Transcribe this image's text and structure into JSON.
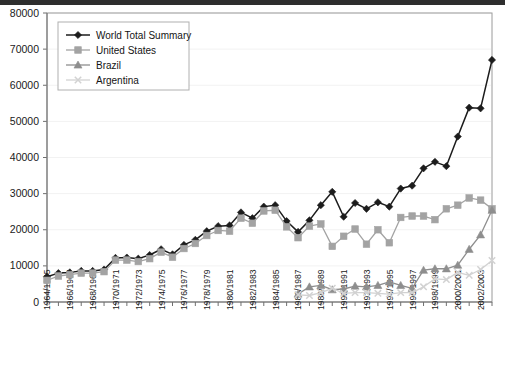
{
  "chart_data": {
    "type": "line",
    "title": "",
    "subtitle": "",
    "xlabel": "",
    "ylabel": "",
    "ylim": [
      0,
      80000
    ],
    "ytick_step": 10000,
    "yticks": [
      "0",
      "10000",
      "20000",
      "30000",
      "40000",
      "50000",
      "60000",
      "70000",
      "80000"
    ],
    "grid": true,
    "grid_axis": "y",
    "legend_position": "top-left",
    "x": [
      "1964/1965",
      "1965/1966",
      "1966/1967",
      "1967/1968",
      "1968/1969",
      "1969/1970",
      "1970/1971",
      "1971/1972",
      "1972/1973",
      "1973/1974",
      "1974/1975",
      "1975/1976",
      "1976/1977",
      "1977/1978",
      "1978/1979",
      "1979/1980",
      "1980/1981",
      "1981/1982",
      "1982/1983",
      "1983/1984",
      "1984/1985",
      "1985/1986",
      "1986/1987",
      "1987/1988",
      "1988/1989",
      "1989/1990",
      "1990/1991",
      "1991/1992",
      "1992/1993",
      "1993/1994",
      "1994/1995",
      "1995/1996",
      "1996/1997",
      "1997/1998",
      "1998/1999",
      "1999/2000",
      "2000/2001",
      "2001/2002",
      "2002/2003",
      "2003/2004"
    ],
    "xtick_labels_shown": [
      "1964/1965",
      "1966/1967",
      "1968/1969",
      "1970/1971",
      "1972/1973",
      "1974/1975",
      "1976/1977",
      "1978/1979",
      "1980/1981",
      "1982/1983",
      "1984/1985",
      "1986/1987",
      "1988/1989",
      "1990/1991",
      "1992/1993",
      "1994/1995",
      "1996/1997",
      "1998/1999",
      "2000/2001",
      "2002/2003"
    ],
    "xtick_label_interval": 2,
    "series": [
      {
        "name": "World Total Summary",
        "marker": "diamond",
        "color": "#1c1c1c",
        "values": [
          7000,
          8000,
          8200,
          8600,
          8600,
          9000,
          12200,
          12300,
          12000,
          13000,
          14600,
          13200,
          15800,
          17200,
          19600,
          21000,
          21200,
          24800,
          23200,
          26400,
          26800,
          22400,
          19400,
          22600,
          26800,
          30500,
          23600,
          27400,
          25800,
          27600,
          26400,
          31400,
          32200,
          37000,
          38800,
          37600,
          45800,
          53800,
          53600,
          67000
        ]
      },
      {
        "name": "United States",
        "marker": "square",
        "color": "#a3a3a3",
        "values": [
          6000,
          7200,
          7600,
          8000,
          8000,
          8400,
          11600,
          11600,
          11200,
          12000,
          13800,
          12400,
          14800,
          16200,
          18400,
          19800,
          19600,
          23200,
          21800,
          25200,
          25400,
          20800,
          17800,
          21000,
          21600,
          15400,
          18200,
          20200,
          16000,
          20000,
          16400,
          23400,
          23800,
          23800,
          22800,
          25800,
          26800,
          28800,
          28200,
          25800
        ]
      },
      {
        "name": "Brazil",
        "marker": "triangle",
        "color": "#8e8e8e",
        "values": [
          null,
          null,
          null,
          null,
          null,
          null,
          null,
          null,
          null,
          null,
          null,
          null,
          null,
          null,
          null,
          null,
          null,
          null,
          null,
          null,
          null,
          null,
          2200,
          4200,
          4600,
          3400,
          3600,
          4400,
          4200,
          4600,
          5600,
          4600,
          3800,
          8800,
          9200,
          9200,
          10200,
          14600,
          18600,
          25400
        ]
      },
      {
        "name": "Argentina",
        "marker": "cross",
        "color": "#d2d2d2",
        "values": [
          null,
          null,
          null,
          null,
          null,
          null,
          null,
          null,
          null,
          null,
          null,
          null,
          null,
          null,
          null,
          null,
          null,
          null,
          null,
          null,
          null,
          null,
          2000,
          1800,
          2600,
          3800,
          2400,
          2600,
          2600,
          2400,
          2200,
          2600,
          2600,
          4200,
          6400,
          6200,
          8200,
          7400,
          9000,
          11500
        ]
      }
    ]
  }
}
